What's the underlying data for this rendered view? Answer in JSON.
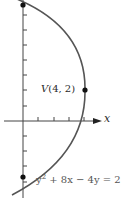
{
  "diagram": {
    "colors": {
      "curve": "#555555",
      "axis": "#444444",
      "point": "#111111",
      "text": "#2a2a2a"
    },
    "vertex_label": "V(4, 2)",
    "vertex_label_parts": {
      "letter": "V",
      "coords": "(4, 2)"
    },
    "x_axis_label": "x",
    "equation": {
      "text": "y² + 8x − 4y = 28",
      "visible_text": "y² + 8x − 4y = 2",
      "y_base": "y",
      "y_exp": "2",
      "rest": " + 8x − 4y = 2"
    },
    "points": [
      {
        "name": "vertex",
        "x": 4,
        "y": 2
      },
      {
        "name": "y-intercept-top",
        "x": 0,
        "y": 7.66
      },
      {
        "name": "y-intercept-bottom",
        "x": 0,
        "y": -3.66
      }
    ],
    "axes": {
      "origin_px": [
        23,
        121
      ],
      "unit_px": 15.3,
      "x_ticks": [
        1,
        2,
        3,
        4
      ],
      "y_ticks": [
        -4,
        -3,
        -2,
        -1,
        1,
        2,
        3,
        4,
        5,
        6,
        7
      ]
    }
  }
}
